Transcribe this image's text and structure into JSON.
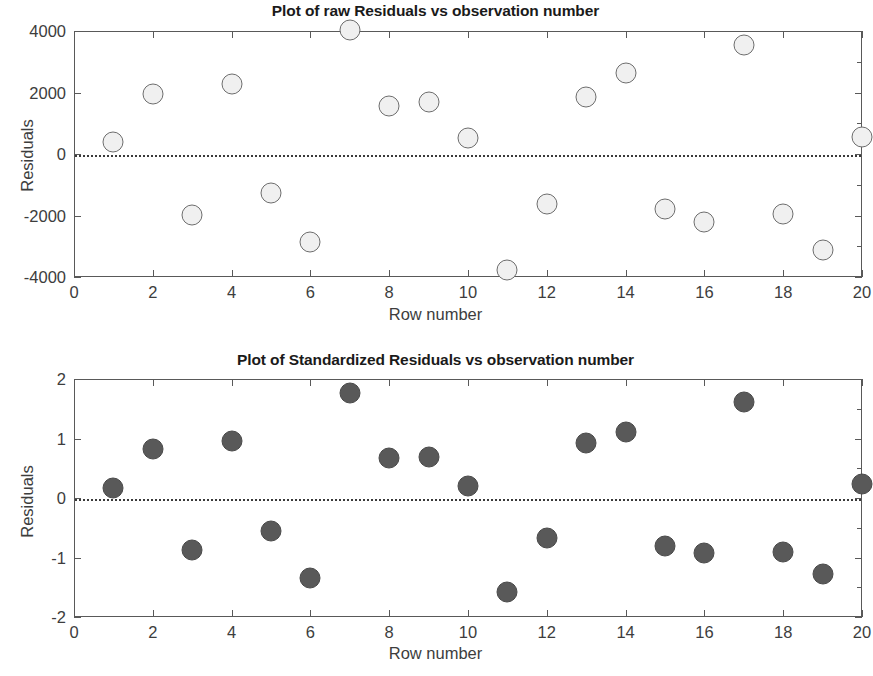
{
  "charts": [
    {
      "id": "raw-residuals",
      "title": "Plot of raw Residuals vs observation number",
      "xlabel": "Row number",
      "ylabel": "Residuals",
      "xticks": [
        "0",
        "2",
        "4",
        "6",
        "8",
        "10",
        "12",
        "14",
        "16",
        "18",
        "20"
      ],
      "yticks": [
        "4000",
        "2000",
        "0",
        "-2000",
        "-4000"
      ],
      "marker_style": "open-circle",
      "marker_fill": "#f0f0f0",
      "marker_edge": "#6d6d6d"
    },
    {
      "id": "standardized-residuals",
      "title": "Plot of Standardized Residuals vs observation number",
      "xlabel": "Row number",
      "ylabel": "Residuals",
      "xticks": [
        "0",
        "2",
        "4",
        "6",
        "8",
        "10",
        "12",
        "14",
        "16",
        "18",
        "20"
      ],
      "yticks": [
        "2",
        "1",
        "0",
        "-1",
        "-2"
      ],
      "marker_style": "filled-circle",
      "marker_fill": "#595959",
      "marker_edge": "#4a4a4a"
    }
  ],
  "chart_data": [
    {
      "type": "scatter",
      "title": "Plot of raw Residuals vs observation number",
      "xlabel": "Row number",
      "ylabel": "Residuals",
      "xlim": [
        0,
        20
      ],
      "ylim": [
        -4000,
        4000
      ],
      "xticks": [
        0,
        2,
        4,
        6,
        8,
        10,
        12,
        14,
        16,
        18,
        20
      ],
      "yticks": [
        -4000,
        -2000,
        0,
        2000,
        4000
      ],
      "grid": false,
      "legend": null,
      "reference_line": {
        "y": 0,
        "style": "dotted"
      },
      "x": [
        1,
        2,
        3,
        4,
        5,
        6,
        7,
        8,
        9,
        10,
        11,
        12,
        13,
        14,
        15,
        16,
        17,
        18,
        19,
        20
      ],
      "values": [
        400,
        1950,
        -1970,
        2270,
        -1280,
        -2850,
        4030,
        1560,
        1680,
        520,
        -3760,
        -1630,
        1840,
        2630,
        -1780,
        -2200,
        3550,
        -1950,
        -3120,
        560
      ]
    },
    {
      "type": "scatter",
      "title": "Plot of Standardized Residuals vs observation number",
      "xlabel": "Row number",
      "ylabel": "Residuals",
      "xlim": [
        0,
        20
      ],
      "ylim": [
        -2,
        2
      ],
      "xticks": [
        0,
        2,
        4,
        6,
        8,
        10,
        12,
        14,
        16,
        18,
        20
      ],
      "yticks": [
        -2,
        -1,
        0,
        1,
        2
      ],
      "grid": false,
      "legend": null,
      "reference_line": {
        "y": 0,
        "style": "dotted"
      },
      "x": [
        1,
        2,
        3,
        4,
        5,
        6,
        7,
        8,
        9,
        10,
        11,
        12,
        13,
        14,
        15,
        16,
        17,
        18,
        19,
        20
      ],
      "values": [
        0.17,
        0.82,
        -0.88,
        0.96,
        -0.55,
        -1.34,
        1.76,
        0.68,
        0.69,
        0.2,
        -1.58,
        -0.68,
        0.93,
        1.11,
        -0.81,
        -0.93,
        1.62,
        -0.91,
        -1.28,
        0.23
      ]
    }
  ]
}
